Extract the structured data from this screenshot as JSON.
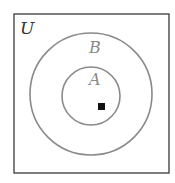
{
  "diagram": {
    "type": "venn",
    "universe": {
      "label": "U",
      "color": "#333333"
    },
    "sets": [
      {
        "label": "B",
        "contains": [
          "A"
        ],
        "color": "#8a8a8a"
      },
      {
        "label": "A",
        "contained_in": "B",
        "color": "#8a8a8a"
      }
    ],
    "marker": {
      "shape": "square",
      "region": "A",
      "color": "#111111"
    }
  }
}
